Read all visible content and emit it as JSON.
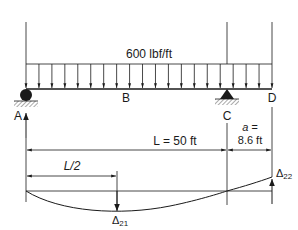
{
  "diagram": {
    "type": "beam-deflection",
    "load": {
      "label": "600 lbf/ft",
      "arrows": 20
    },
    "points": {
      "A": "A",
      "B": "B",
      "C": "C",
      "D": "D"
    },
    "dimensions": {
      "span": "L = 50 ft",
      "half_span": "L/2",
      "overhang_line1": "a =",
      "overhang_line2": "8.6 ft"
    },
    "deflections": {
      "mid": "Δ",
      "mid_sub": "21",
      "tip": "Δ",
      "tip_sub": "22"
    },
    "colors": {
      "line": "#1a1a1a",
      "hatch": "#555555"
    }
  }
}
